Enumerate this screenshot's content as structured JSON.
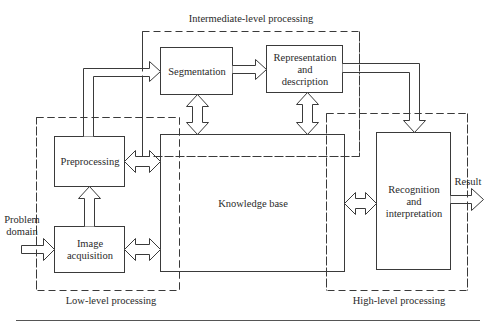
{
  "diagram": {
    "type": "block-diagram",
    "regions": {
      "intermediate": {
        "label": "Intermediate-level processing"
      },
      "low": {
        "label": "Low-level processing"
      },
      "high": {
        "label": "High-level processing"
      }
    },
    "blocks": {
      "segmentation": {
        "label": "Segmentation"
      },
      "representation": {
        "line1": "Representation",
        "line2": "and",
        "line3": "description"
      },
      "preprocessing": {
        "label": "Preprocessing"
      },
      "knowledge_base": {
        "label": "Knowledge base"
      },
      "image_acquisition": {
        "line1": "Image",
        "line2": "acquisition"
      },
      "recognition": {
        "line1": "Recognition",
        "line2": "and",
        "line3": "interpretation"
      }
    },
    "io": {
      "input": {
        "line1": "Problem",
        "line2": "domain"
      },
      "output": {
        "label": "Result"
      }
    },
    "edges": [
      {
        "from": "Problem domain",
        "to": "Image acquisition",
        "type": "one-way"
      },
      {
        "from": "Image acquisition",
        "to": "Preprocessing",
        "type": "one-way"
      },
      {
        "from": "Preprocessing",
        "to": "Segmentation",
        "type": "one-way"
      },
      {
        "from": "Segmentation",
        "to": "Representation and description",
        "type": "one-way"
      },
      {
        "from": "Representation and description",
        "to": "Recognition and interpretation",
        "type": "one-way"
      },
      {
        "from": "Recognition and interpretation",
        "to": "Result",
        "type": "one-way"
      },
      {
        "from": "Knowledge base",
        "to": "Image acquisition",
        "type": "two-way"
      },
      {
        "from": "Knowledge base",
        "to": "Preprocessing",
        "type": "two-way"
      },
      {
        "from": "Knowledge base",
        "to": "Segmentation",
        "type": "two-way"
      },
      {
        "from": "Knowledge base",
        "to": "Representation and description",
        "type": "two-way"
      },
      {
        "from": "Knowledge base",
        "to": "Recognition and interpretation",
        "type": "two-way"
      }
    ],
    "colors": {
      "line": "#3a3a3a",
      "background": "#ffffff"
    }
  }
}
